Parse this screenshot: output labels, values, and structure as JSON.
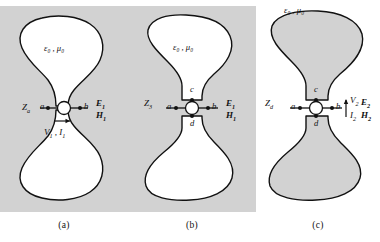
{
  "figure": {
    "caption_a": "(a)",
    "caption_b": "(b)",
    "caption_c": "(c)",
    "colors": {
      "panel_background": "#d2d2d2",
      "region_fill_a": "#ffffff",
      "region_fill_b": "#ffffff",
      "region_fill_c": "#d2d2d2",
      "outline": "#111111",
      "text": "#111111"
    }
  },
  "panels": {
    "a": {
      "caption": "(a)",
      "medium_label": "ε₀ , μ₀",
      "impedance_label": "Z",
      "impedance_sub": "a",
      "terminal_left": "a",
      "terminal_right": "b",
      "field_e": "E",
      "field_e_sub": "1",
      "field_h": "H",
      "field_h_sub": "1",
      "source_arrow_direction": "right",
      "vi_label": "V",
      "vi_label_sub": "1",
      "current_label": "I",
      "current_label_sub": "1",
      "vi_separator": " , "
    },
    "b": {
      "caption": "(b)",
      "medium_label": "ε₀ , μ₀",
      "impedance_label": "Z",
      "impedance_sub": "3",
      "terminal_left": "a",
      "terminal_right": "b",
      "terminal_top": "c",
      "terminal_bottom": "d",
      "field_e": "E",
      "field_e_sub": "1",
      "field_h": "H",
      "field_h_sub": "1"
    },
    "c": {
      "caption": "(c)",
      "medium_label": "ε₀ , μ₀",
      "impedance_label": "Z",
      "impedance_sub": "d",
      "terminal_left": "a",
      "terminal_right": "b",
      "terminal_top": "c",
      "terminal_bottom": "d",
      "field_e": "E",
      "field_e_sub": "2",
      "field_h": "H",
      "field_h_sub": "2",
      "voltage_label": "V",
      "voltage_label_sub": "2",
      "current_label": "I",
      "current_label_sub": "2",
      "arrow_direction": "up"
    }
  }
}
